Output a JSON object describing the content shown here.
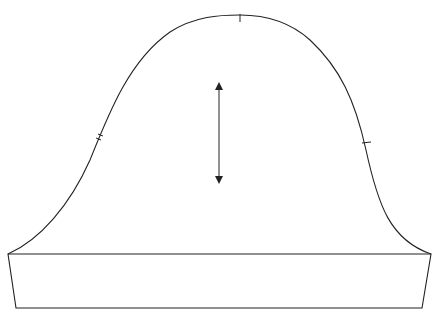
{
  "diagram": {
    "title": "",
    "parts": [
      {
        "name": "sleeve-cap",
        "label": ""
      },
      {
        "name": "cuff-band",
        "label": ""
      }
    ],
    "markings": [
      {
        "name": "top-notch",
        "type": "single notch"
      },
      {
        "name": "back-notch",
        "type": "double notch"
      },
      {
        "name": "front-notch",
        "type": "single notch"
      },
      {
        "name": "grainline-arrow",
        "type": "double-headed arrow"
      }
    ],
    "line_color": "#222222",
    "background": "#ffffff"
  }
}
